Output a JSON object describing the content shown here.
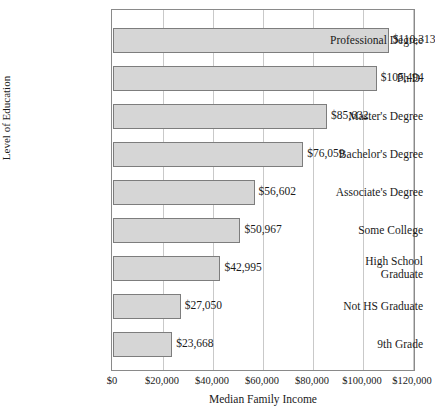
{
  "chart_data": {
    "type": "bar",
    "orientation": "horizontal",
    "title": "",
    "xlabel": "Median Family Income",
    "ylabel": "Level of Education",
    "categories": [
      "Professional Degree",
      "Ph.D.",
      "Master's Degree",
      "Bachelor's Degree",
      "Associate's Degree",
      "Some College",
      "High School\nGraduate",
      "Not HS Graduate",
      "9th Grade"
    ],
    "values": [
      110313,
      105494,
      85632,
      76059,
      56602,
      50967,
      42995,
      27050,
      23668
    ],
    "value_labels": [
      "$110,313",
      "$105,494",
      "$85,632",
      "$76,059",
      "$56,602",
      "$50,967",
      "$42,995",
      "$27,050",
      "$23,668"
    ],
    "xlim": [
      0,
      121500
    ],
    "xticks": [
      0,
      20000,
      40000,
      60000,
      80000,
      100000,
      120000
    ],
    "xtick_labels": [
      "$0",
      "$20,000",
      "$40,000",
      "$60,000",
      "$80,000",
      "$100,000",
      "$120,000"
    ],
    "grid": "vertical",
    "legend": "none",
    "bar_fill": "#d6d6d6",
    "bar_border": "#7d7d7d",
    "gridline_color": "#c9c9c9",
    "frame_color": "#8a8a8a"
  }
}
